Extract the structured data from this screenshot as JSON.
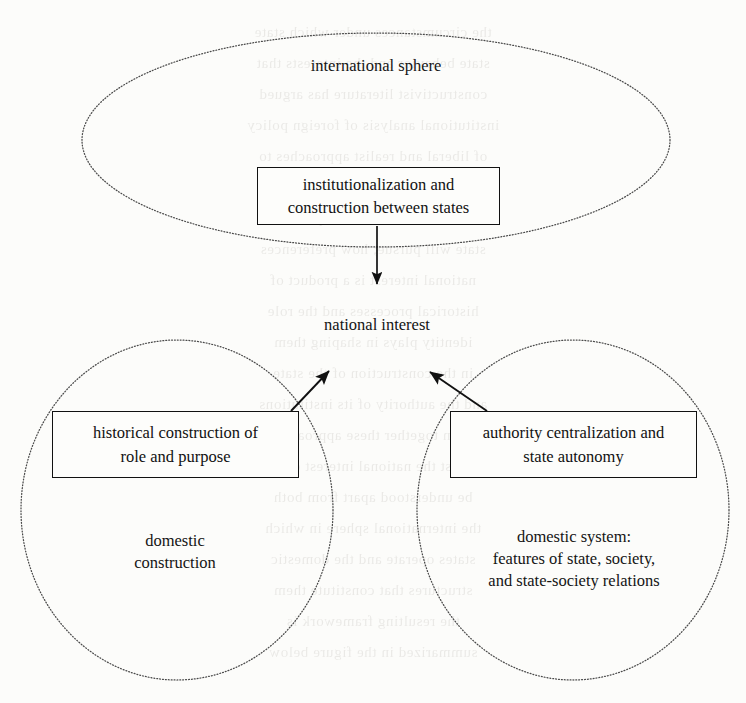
{
  "diagram": {
    "background_color": "#fcfcfa",
    "ink_color": "#111111",
    "shapes": {
      "international_sphere_ellipse": {
        "name": "international sphere",
        "style": "dotted ellipse",
        "cx": 376,
        "cy": 140,
        "rx": 294,
        "ry": 107
      },
      "domestic_construction_ellipse": {
        "name": "domestic construction",
        "style": "dotted ellipse",
        "cx": 177,
        "cy": 510,
        "rx": 156,
        "ry": 170
      },
      "domestic_system_ellipse": {
        "name": "domestic system",
        "style": "dotted ellipse",
        "cx": 573,
        "cy": 510,
        "rx": 156,
        "ry": 170
      }
    },
    "labels": {
      "international_sphere": "international sphere",
      "national_interest": "national interest",
      "domestic_construction": "domestic\nconstruction",
      "domestic_system": "domestic system:\nfeatures of state, society,\nand state-society relations"
    },
    "boxes": {
      "institutionalization": "institutionalization and\nconstruction between states",
      "historical_construction": "historical construction of\nrole and purpose",
      "authority_centralization": "authority centralization and\nstate autonomy"
    },
    "arrows": [
      {
        "name": "arrow-institutionalization-to-national-interest",
        "from": "institutionalization and construction between states",
        "to": "national interest",
        "direction": "down"
      },
      {
        "name": "arrow-historical-construction-to-national-interest",
        "from": "historical construction of role and purpose",
        "to": "national interest",
        "direction": "up-right"
      },
      {
        "name": "arrow-authority-centralization-to-national-interest",
        "from": "authority centralization and state autonomy",
        "to": "national interest",
        "direction": "up-left"
      }
    ]
  },
  "background_bleed": {
    "lines": [
      "the circumstances under which state",
      "state behavior and the interests that",
      "constructivist literature has argued",
      "institutional analysis of foreign policy",
      "of liberal and realist approaches to",
      "see national interests as given and",
      "domestic factors that shape what a",
      "state will pursue; how preferences",
      "national interest is a product of",
      "historical processes and the role",
      "identity plays in shaping them",
      "in the construction of the state",
      "and the authority of its institutions",
      "taken together these approaches",
      "suggest the national interest cannot",
      "be understood apart from both",
      "the international sphere in which",
      "states operate and the domestic",
      "structures that constitute them",
      "the resulting framework is",
      "summarized in the figure below"
    ]
  }
}
